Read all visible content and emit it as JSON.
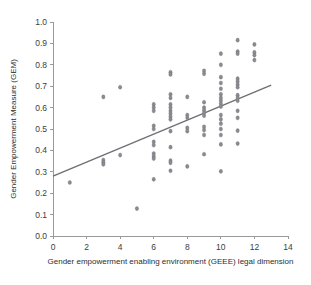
{
  "chart_data": {
    "type": "scatter",
    "title": "",
    "xlabel": "Gender empowerment enabling environment (GEEE) legal dimension",
    "ylabel": "Gender Empowerment Measure (GEM)",
    "xlim": [
      0,
      14
    ],
    "ylim": [
      0,
      1.0
    ],
    "xticks": [
      0,
      2,
      4,
      6,
      8,
      10,
      12,
      14
    ],
    "xtick_labels": [
      "0",
      "2",
      "4",
      "6",
      "8",
      "10",
      "12",
      "14"
    ],
    "yticks": [
      0.0,
      0.1,
      0.2,
      0.3,
      0.4,
      0.5,
      0.6,
      0.7,
      0.8,
      0.9,
      1.0
    ],
    "ytick_labels": [
      "0.0",
      "0.1",
      "0.2",
      "0.3",
      "0.4",
      "0.5",
      "0.6",
      "0.7",
      "0.8",
      "0.9",
      "1.0"
    ],
    "grid": false,
    "legend": "none",
    "marker_color": "#8a8a90",
    "trendline_color": "#6f6f75",
    "axis_color": "#9a9a9a",
    "trendline": {
      "x": [
        0,
        13
      ],
      "y": [
        0.28,
        0.705
      ]
    },
    "points": [
      [
        1,
        0.25
      ],
      [
        3,
        0.65
      ],
      [
        3,
        0.355
      ],
      [
        3,
        0.345
      ],
      [
        3,
        0.335
      ],
      [
        4,
        0.695
      ],
      [
        4,
        0.378
      ],
      [
        5,
        0.128
      ],
      [
        6,
        0.615
      ],
      [
        6,
        0.6
      ],
      [
        6,
        0.585
      ],
      [
        6,
        0.515
      ],
      [
        6,
        0.5
      ],
      [
        6,
        0.44
      ],
      [
        6,
        0.425
      ],
      [
        6,
        0.385
      ],
      [
        6,
        0.372
      ],
      [
        6,
        0.362
      ],
      [
        6,
        0.265
      ],
      [
        7,
        0.765
      ],
      [
        7,
        0.755
      ],
      [
        7,
        0.662
      ],
      [
        7,
        0.645
      ],
      [
        7,
        0.615
      ],
      [
        7,
        0.6
      ],
      [
        7,
        0.585
      ],
      [
        7,
        0.572
      ],
      [
        7,
        0.558
      ],
      [
        7,
        0.545
      ],
      [
        7,
        0.49
      ],
      [
        7,
        0.415
      ],
      [
        7,
        0.352
      ],
      [
        7,
        0.342
      ],
      [
        7,
        0.305
      ],
      [
        8,
        0.65
      ],
      [
        8,
        0.565
      ],
      [
        8,
        0.552
      ],
      [
        8,
        0.505
      ],
      [
        8,
        0.49
      ],
      [
        8,
        0.325
      ],
      [
        9,
        0.772
      ],
      [
        9,
        0.758
      ],
      [
        9,
        0.625
      ],
      [
        9,
        0.6
      ],
      [
        9,
        0.588
      ],
      [
        9,
        0.575
      ],
      [
        9,
        0.562
      ],
      [
        9,
        0.51
      ],
      [
        9,
        0.495
      ],
      [
        9,
        0.472
      ],
      [
        9,
        0.382
      ],
      [
        10,
        0.852
      ],
      [
        10,
        0.8
      ],
      [
        10,
        0.742
      ],
      [
        10,
        0.715
      ],
      [
        10,
        0.688
      ],
      [
        10,
        0.662
      ],
      [
        10,
        0.645
      ],
      [
        10,
        0.632
      ],
      [
        10,
        0.618
      ],
      [
        10,
        0.605
      ],
      [
        10,
        0.565
      ],
      [
        10,
        0.545
      ],
      [
        10,
        0.525
      ],
      [
        10,
        0.5
      ],
      [
        10,
        0.472
      ],
      [
        10,
        0.428
      ],
      [
        10,
        0.302
      ],
      [
        11,
        0.915
      ],
      [
        11,
        0.862
      ],
      [
        11,
        0.852
      ],
      [
        11,
        0.735
      ],
      [
        11,
        0.722
      ],
      [
        11,
        0.708
      ],
      [
        11,
        0.695
      ],
      [
        11,
        0.658
      ],
      [
        11,
        0.645
      ],
      [
        11,
        0.632
      ],
      [
        11,
        0.585
      ],
      [
        11,
        0.552
      ],
      [
        11,
        0.492
      ],
      [
        11,
        0.432
      ],
      [
        12,
        0.895
      ],
      [
        12,
        0.858
      ],
      [
        12,
        0.845
      ],
      [
        12,
        0.822
      ]
    ]
  }
}
